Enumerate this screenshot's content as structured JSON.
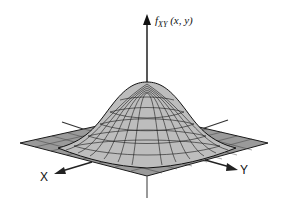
{
  "figure": {
    "title": "",
    "z_axis_label": "f_XY(x, y)",
    "z_axis_label_main": "f",
    "z_axis_label_sub": "XY",
    "z_axis_label_args": "(x, y)",
    "x_axis_label": "X",
    "y_axis_label": "Y",
    "surface": "bivariate Gaussian probability density (wireframe mesh)",
    "colors": {
      "mesh": "#1a1a1a",
      "axes": "#222222",
      "background": "#ffffff"
    }
  }
}
